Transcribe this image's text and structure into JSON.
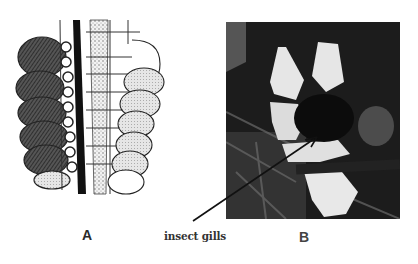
{
  "figure": {
    "panel_a": {
      "label": "A",
      "description": "line drawing of insect body segment with leaf-like gill lamellae on both sides of a dark central trunk"
    },
    "panel_b": {
      "label": "B",
      "description": "grayscale photograph of an insect larva showing pale gills"
    },
    "annotation": {
      "text": "insect gills",
      "pointer": "arrow pointing into photograph B"
    },
    "colors": {
      "background": "#ffffff",
      "ink": "#1a1a1a",
      "photo_dark": "#1c1c1c",
      "photo_light": "#e8e8e8"
    }
  }
}
